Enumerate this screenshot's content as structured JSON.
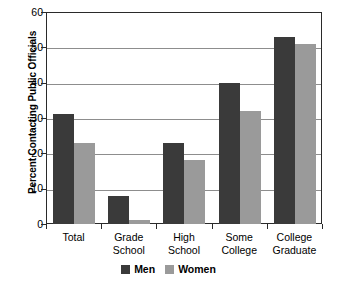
{
  "chart_data": {
    "type": "bar",
    "title": "",
    "subtitle": "",
    "xlabel": "",
    "ylabel": "Percent Contacting Public Officials",
    "ylim": [
      0,
      60
    ],
    "yticks": [
      0,
      10,
      20,
      30,
      40,
      50,
      60
    ],
    "ytick_labels": [
      "0",
      "10",
      "20",
      "30",
      "40",
      "50",
      "60"
    ],
    "grid": "horizontal",
    "legend_position": "bottom-center",
    "categories": [
      "Total",
      "Grade School",
      "High School",
      "Some College",
      "College Graduate"
    ],
    "category_lines": [
      [
        "Total",
        ""
      ],
      [
        "Grade",
        "School"
      ],
      [
        "High",
        "School"
      ],
      [
        "Some",
        "College"
      ],
      [
        "College",
        "Graduate"
      ]
    ],
    "series": [
      {
        "name": "Men",
        "color": "#3a3a3a",
        "values": [
          31,
          8,
          23,
          40,
          53
        ]
      },
      {
        "name": "Women",
        "color": "#9a9a9a",
        "values": [
          23,
          1,
          18,
          32,
          51
        ]
      }
    ]
  },
  "legend": {
    "entries": [
      {
        "label": "Men",
        "color": "#3a3a3a"
      },
      {
        "label": "Women",
        "color": "#9a9a9a"
      }
    ]
  },
  "colors": {
    "men": "#3a3a3a",
    "women": "#9a9a9a",
    "axis": "#2a2a2a",
    "gridline": "#8d8d8d",
    "background": "#ffffff"
  }
}
